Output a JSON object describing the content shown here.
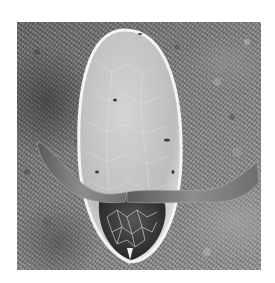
{
  "image": {
    "description": "Scanning electron micrograph of an elongated insect egg with lateral floats on a textured surface",
    "colors": {
      "background": "#ffffff",
      "substrate": "#808080",
      "egg_shell": "#d8d8d8",
      "egg_edge": "#f2f2f2",
      "anterior_dark": "#3a3a3a"
    }
  }
}
